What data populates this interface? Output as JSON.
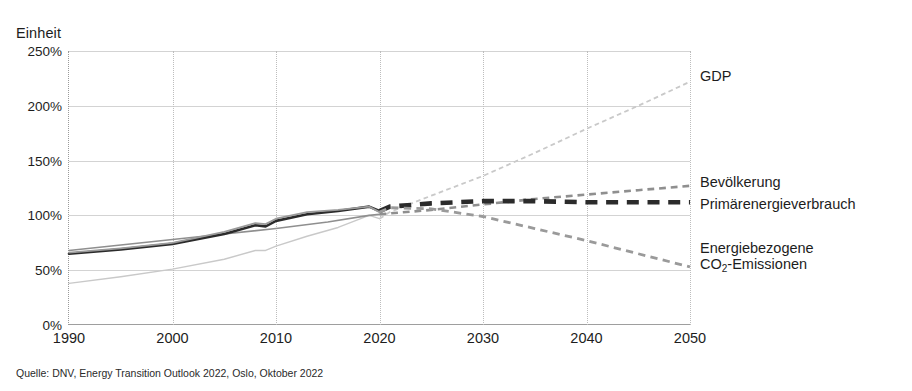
{
  "axis_unit_label": "Einheit",
  "source_note": "Quelle: DNV, Energy Transition Outlook 2022, Oslo, Oktober 2022",
  "labels": {
    "gdp": "GDP",
    "population": "Bevölkerung",
    "primary_energy": "Primärenergieverbrauch",
    "co2_line1": "Energiebezogene",
    "co2_line2_pre": "CO",
    "co2_line2_sub": "2",
    "co2_line2_post": "-Emissionen"
  },
  "colors": {
    "gdp": "#c9c9c9",
    "population": "#8f8f8f",
    "primary_energy": "#2b2b2b",
    "co2": "#9a9a9a",
    "grid": "#d3d3d3",
    "axis": "#9e9e9e"
  },
  "chart_data": {
    "type": "line",
    "title": "",
    "subtitle": "",
    "xlabel": "",
    "ylabel": "Einheit",
    "xlim": [
      1990,
      2050
    ],
    "ylim": [
      0,
      250
    ],
    "ytick_labels": [
      "250%",
      "200%",
      "150%",
      "100%",
      "50%",
      "0%"
    ],
    "ytick_values": [
      250,
      200,
      150,
      100,
      50,
      0
    ],
    "xtick_labels": [
      "1990",
      "2000",
      "2010",
      "2020",
      "2030",
      "2040",
      "2050"
    ],
    "xtick_values": [
      1990,
      2000,
      2010,
      2020,
      2030,
      2040,
      2050
    ],
    "grid": true,
    "legend_position": "right-inline-labels",
    "history_forecast_split_year": 2020,
    "units": "percent (index, 2019 = 100%)",
    "series": [
      {
        "name": "GDP",
        "color": "#c9c9c9",
        "style_history": "solid",
        "style_forecast": "dashed",
        "x": [
          1990,
          1995,
          2000,
          2005,
          2008,
          2009,
          2010,
          2013,
          2016,
          2019,
          2020,
          2021,
          2025,
          2030,
          2035,
          2040,
          2045,
          2050
        ],
        "values": [
          38,
          44,
          51,
          60,
          68,
          68,
          72,
          81,
          89,
          100,
          97,
          103,
          118,
          136,
          157,
          179,
          200,
          222
        ]
      },
      {
        "name": "Bevölkerung",
        "color": "#8f8f8f",
        "style_history": "solid",
        "style_forecast": "dashed",
        "x": [
          1990,
          1995,
          2000,
          2005,
          2010,
          2015,
          2019,
          2020,
          2025,
          2030,
          2035,
          2040,
          2045,
          2050
        ],
        "values": [
          68,
          73,
          78,
          83,
          88,
          94,
          100,
          101,
          105,
          110,
          115,
          119,
          123,
          127
        ]
      },
      {
        "name": "Primärenergieverbrauch",
        "color": "#2b2b2b",
        "style_history": "solid",
        "style_forecast": "dashed",
        "x": [
          1990,
          1995,
          2000,
          2005,
          2008,
          2009,
          2010,
          2013,
          2016,
          2019,
          2020,
          2021,
          2025,
          2030,
          2035,
          2040,
          2045,
          2050
        ],
        "values": [
          65,
          69,
          74,
          83,
          91,
          90,
          95,
          101,
          104,
          108,
          104,
          108,
          111,
          113,
          113,
          112,
          112,
          112
        ]
      },
      {
        "name": "Energiebezogene CO2-Emissionen",
        "color": "#9a9a9a",
        "style_history": "solid",
        "style_forecast": "dashed",
        "x": [
          1990,
          1995,
          2000,
          2005,
          2008,
          2009,
          2010,
          2013,
          2016,
          2019,
          2020,
          2021,
          2025,
          2030,
          2035,
          2040,
          2045,
          2050
        ],
        "values": [
          66,
          70,
          75,
          85,
          93,
          92,
          97,
          103,
          105,
          108,
          103,
          107,
          106,
          99,
          88,
          77,
          65,
          53
        ]
      }
    ],
    "annotations": [
      {
        "text": "GDP",
        "at_year": 2050,
        "at_value": 222
      },
      {
        "text": "Bevölkerung",
        "at_year": 2050,
        "at_value": 127
      },
      {
        "text": "Primärenergieverbrauch",
        "at_year": 2050,
        "at_value": 112
      },
      {
        "text": "Energiebezogene CO2-Emissionen",
        "at_year": 2050,
        "at_value": 53
      }
    ]
  }
}
